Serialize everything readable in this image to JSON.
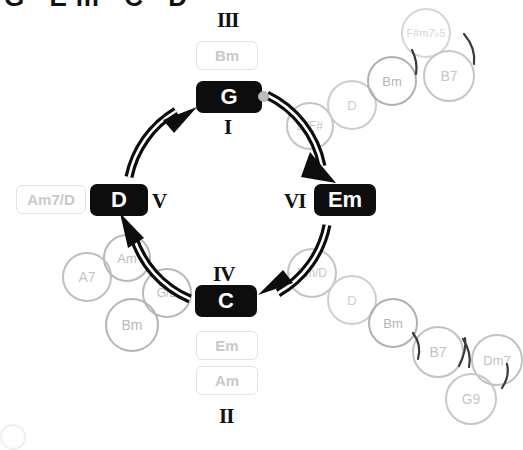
{
  "page": {
    "clipped_heading": "G Em C D",
    "background": "#ffffff",
    "accent_dark": "#0d0d0d",
    "ghost_gray": "#c9c9c9",
    "ghost_gray_strong": "#a8a8a8"
  },
  "diagram": {
    "type": "chord-progression-circle",
    "center": {
      "x": 228,
      "y": 200
    },
    "radius": 100,
    "direction": "clockwise",
    "start_marker": {
      "at": "G",
      "side": "right"
    }
  },
  "chips": [
    {
      "id": "g",
      "label": "G",
      "roman": "I",
      "roman_pos": "below",
      "x": 196,
      "y": 81,
      "w": 66,
      "h": 32,
      "font": 22
    },
    {
      "id": "em",
      "label": "Em",
      "roman": "VI",
      "roman_pos": "left",
      "x": 314,
      "y": 184,
      "w": 62,
      "h": 32,
      "font": 22
    },
    {
      "id": "c",
      "label": "C",
      "roman": "IV",
      "roman_pos": "above",
      "x": 195,
      "y": 285,
      "w": 62,
      "h": 32,
      "font": 22
    },
    {
      "id": "d",
      "label": "D",
      "roman": "V",
      "roman_pos": "right",
      "x": 90,
      "y": 184,
      "w": 58,
      "h": 32,
      "font": 22
    }
  ],
  "romans": [
    {
      "id": "III",
      "label": "III",
      "x": 217,
      "y": 8
    },
    {
      "id": "I",
      "label": "I",
      "x": 224,
      "y": 115
    },
    {
      "id": "VI",
      "label": "VI",
      "x": 284,
      "y": 189
    },
    {
      "id": "V",
      "label": "V",
      "x": 152,
      "y": 189
    },
    {
      "id": "IV",
      "label": "IV",
      "x": 213,
      "y": 262
    },
    {
      "id": "II",
      "label": "II",
      "x": 219,
      "y": 404
    }
  ],
  "light_chips": [
    {
      "id": "bm-top",
      "label": "Bm",
      "x": 196,
      "y": 41,
      "w": 62,
      "h": 29
    },
    {
      "id": "em-bot",
      "label": "Em",
      "x": 196,
      "y": 331,
      "w": 62,
      "h": 29
    },
    {
      "id": "am-bot",
      "label": "Am",
      "x": 196,
      "y": 366,
      "w": 62,
      "h": 29
    },
    {
      "id": "am7-d",
      "label": "Am7/D",
      "x": 16,
      "y": 185,
      "w": 70,
      "h": 29
    }
  ],
  "ghost_circles": [
    {
      "id": "dfsharp",
      "label": "D/F#",
      "cx": 310,
      "cy": 126,
      "r": 24,
      "color": "#c4c4c4",
      "border": "#c4c4c4",
      "font": 12
    },
    {
      "id": "d-tr",
      "label": "D",
      "cx": 352,
      "cy": 105,
      "r": 25,
      "color": "#cccccc",
      "border": "#cccccc",
      "font": 13
    },
    {
      "id": "bm-tr",
      "label": "Bm",
      "cx": 392,
      "cy": 81,
      "r": 25,
      "color": "#b4b4b4",
      "border": "#b0b0b0",
      "font": 13
    },
    {
      "id": "fsharpm7",
      "label": "F#m7♭5",
      "cx": 426,
      "cy": 33,
      "r": 25,
      "color": "#d6d6d6",
      "border": "#d6d6d6",
      "font": 11
    },
    {
      "id": "b7-tr",
      "label": "B7",
      "cx": 449,
      "cy": 76,
      "r": 26,
      "color": "#c6c6c6",
      "border": "#c6c6c6",
      "font": 14
    },
    {
      "id": "emd",
      "label": "Em/D",
      "cx": 312,
      "cy": 273,
      "r": 25,
      "color": "#c4c4c4",
      "border": "#c4c4c4",
      "font": 12
    },
    {
      "id": "d-br",
      "label": "D",
      "cx": 352,
      "cy": 300,
      "r": 25,
      "color": "#cfcfcf",
      "border": "#cfcfcf",
      "font": 13
    },
    {
      "id": "bm-br",
      "label": "Bm",
      "cx": 393,
      "cy": 323,
      "r": 25,
      "color": "#b4b4b4",
      "border": "#b0b0b0",
      "font": 13
    },
    {
      "id": "b7-br",
      "label": "B7",
      "cx": 438,
      "cy": 352,
      "r": 26,
      "color": "#c2c2c2",
      "border": "#c2c2c2",
      "font": 14
    },
    {
      "id": "dm7",
      "label": "Dm7",
      "cx": 497,
      "cy": 360,
      "r": 26,
      "color": "#c2c2c2",
      "border": "#c2c2c2",
      "font": 13
    },
    {
      "id": "g9",
      "label": "G9",
      "cx": 471,
      "cy": 399,
      "r": 26,
      "color": "#c7c7c7",
      "border": "#c7c7c7",
      "font": 14
    },
    {
      "id": "am-bl",
      "label": "Am",
      "cx": 127,
      "cy": 258,
      "r": 24,
      "color": "#bdbdbd",
      "border": "#b8b8b8",
      "font": 13
    },
    {
      "id": "a7",
      "label": "A7",
      "cx": 87,
      "cy": 277,
      "r": 25,
      "color": "#c4c4c4",
      "border": "#bfbfbf",
      "font": 14
    },
    {
      "id": "gb",
      "label": "G/B",
      "cx": 167,
      "cy": 293,
      "r": 25,
      "color": "#bcbcbc",
      "border": "#b8b8b8",
      "font": 12
    },
    {
      "id": "bm-bl",
      "label": "Bm",
      "cx": 132,
      "cy": 325,
      "r": 27,
      "color": "#b8b8b8",
      "border": "#b4b4b4",
      "font": 14
    }
  ],
  "tick_marks": {
    "description": "small curved slash separators between outer ghost chord circles",
    "count": 6
  }
}
